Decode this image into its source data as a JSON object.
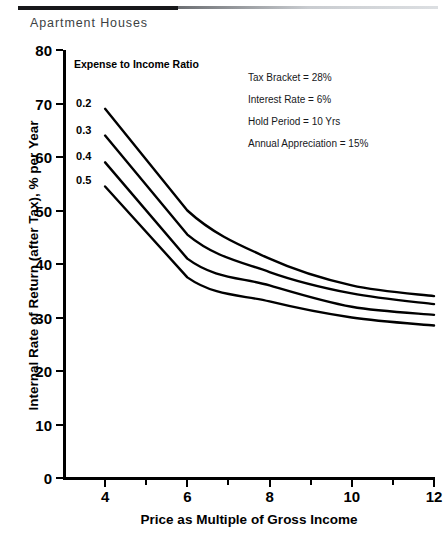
{
  "figure": {
    "heading": "Apartment Houses"
  },
  "chart_data": {
    "type": "line",
    "title": "Apartment Houses",
    "xlabel": "Price as Multiple of Gross Income",
    "ylabel": "Internal Rate of Return (after Tax), % per Year",
    "xlim": [
      3,
      12
    ],
    "ylim": [
      0,
      80
    ],
    "xticks": [
      4,
      6,
      8,
      10,
      12
    ],
    "xticklabels": [
      "4",
      "6",
      "8",
      "10",
      "12"
    ],
    "yticks": [
      0,
      10,
      20,
      30,
      40,
      50,
      60,
      70,
      80
    ],
    "yticklabels": [
      "0",
      "10",
      "20",
      "30",
      "40",
      "50",
      "60",
      "70",
      "80"
    ],
    "grid": false,
    "legend_title": "Expense to Income Ratio",
    "legend_position": "inline-left",
    "x": [
      4,
      6,
      8,
      10,
      12
    ],
    "series": [
      {
        "name": "0.2",
        "label": "0.2",
        "values": [
          69,
          50,
          41,
          36,
          34
        ]
      },
      {
        "name": "0.3",
        "label": "0.3",
        "values": [
          64,
          45.5,
          38.5,
          34.5,
          32.5
        ]
      },
      {
        "name": "0.4",
        "label": "0.4",
        "values": [
          59,
          41,
          36,
          32,
          30.5
        ]
      },
      {
        "name": "0.5",
        "label": "0.5",
        "values": [
          54.5,
          37.5,
          33,
          30,
          28.5
        ]
      }
    ],
    "annotations": [
      "Tax Bracket = 28%",
      "Interest Rate = 6%",
      "Hold Period = 10 Yrs",
      "Annual Appreciation = 15%"
    ],
    "line_color": "#000000"
  }
}
